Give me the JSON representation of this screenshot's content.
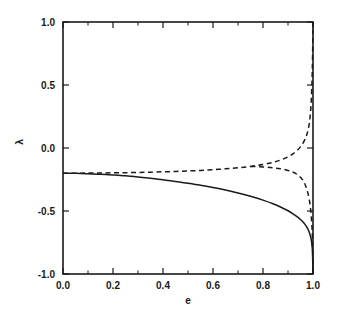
{
  "chart_data": {
    "type": "line",
    "title": "",
    "xlabel": "e",
    "ylabel": "λ",
    "xlim": [
      0.0,
      1.0
    ],
    "ylim": [
      -1.0,
      1.0
    ],
    "grid": false,
    "legend": "none",
    "x_major_ticks": [
      0.0,
      0.2,
      0.4,
      0.6,
      0.8,
      1.0
    ],
    "x_major_tick_labels": [
      "0.0",
      "0.2",
      "0.4",
      "0.6",
      "0.8",
      "1.0"
    ],
    "x_minor_ticks": [
      0.1,
      0.3,
      0.5,
      0.7,
      0.9
    ],
    "y_major_ticks": [
      -1.0,
      -0.5,
      0.0,
      0.5,
      1.0
    ],
    "y_major_tick_labels": [
      "-1.0",
      "-0.5",
      "0.0",
      "0.5",
      "1.0"
    ],
    "series": [
      {
        "name": "solid-branch",
        "style": "solid",
        "x": [
          0.0,
          0.05,
          0.1,
          0.15,
          0.2,
          0.25,
          0.3,
          0.35,
          0.4,
          0.45,
          0.5,
          0.55,
          0.6,
          0.65,
          0.7,
          0.75,
          0.8,
          0.84,
          0.88,
          0.9,
          0.92,
          0.94,
          0.95,
          0.96,
          0.97,
          0.975,
          0.98,
          0.985,
          0.99,
          0.993,
          0.996,
          0.998,
          1.0
        ],
        "y": [
          -0.2,
          -0.201,
          -0.204,
          -0.208,
          -0.214,
          -0.221,
          -0.23,
          -0.24,
          -0.252,
          -0.265,
          -0.28,
          -0.296,
          -0.314,
          -0.334,
          -0.357,
          -0.383,
          -0.414,
          -0.443,
          -0.478,
          -0.498,
          -0.522,
          -0.551,
          -0.568,
          -0.588,
          -0.612,
          -0.627,
          -0.645,
          -0.668,
          -0.7,
          -0.728,
          -0.775,
          -0.83,
          -1.0
        ]
      },
      {
        "name": "dashed-upper-branch",
        "style": "dashed",
        "x": [
          0.0,
          0.05,
          0.1,
          0.15,
          0.2,
          0.25,
          0.3,
          0.35,
          0.4,
          0.45,
          0.5,
          0.55,
          0.6,
          0.65,
          0.7,
          0.75,
          0.8,
          0.84,
          0.87,
          0.9,
          0.92,
          0.94,
          0.95,
          0.96,
          0.97,
          0.975,
          0.98,
          0.985,
          0.99,
          0.993,
          0.996,
          0.998,
          1.0
        ],
        "y": [
          -0.2,
          -0.2,
          -0.199,
          -0.198,
          -0.197,
          -0.196,
          -0.194,
          -0.192,
          -0.189,
          -0.186,
          -0.182,
          -0.178,
          -0.172,
          -0.165,
          -0.157,
          -0.146,
          -0.131,
          -0.114,
          -0.096,
          -0.07,
          -0.046,
          -0.012,
          0.01,
          0.038,
          0.078,
          0.105,
          0.14,
          0.192,
          0.28,
          0.375,
          0.53,
          0.7,
          1.0
        ]
      },
      {
        "name": "dashed-lower-branch",
        "style": "dashed",
        "x": [
          0.75,
          0.8,
          0.84,
          0.87,
          0.9,
          0.92,
          0.93,
          0.94,
          0.95,
          0.955,
          0.96,
          0.965,
          0.97,
          0.975,
          0.98,
          0.985,
          0.99,
          0.993,
          0.996,
          0.998,
          1.0
        ],
        "y": [
          -0.146,
          -0.15,
          -0.157,
          -0.165,
          -0.178,
          -0.192,
          -0.201,
          -0.214,
          -0.232,
          -0.244,
          -0.258,
          -0.276,
          -0.298,
          -0.325,
          -0.36,
          -0.408,
          -0.478,
          -0.538,
          -0.63,
          -0.73,
          -1.0
        ]
      }
    ]
  }
}
